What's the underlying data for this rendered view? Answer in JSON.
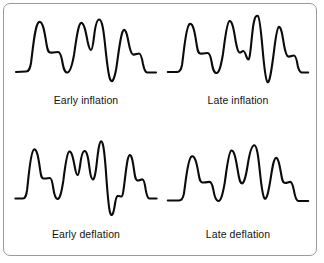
{
  "figure": {
    "background_color": "#ffffff",
    "border_color": "#9b9b9b",
    "trace_color": "#0b0b0b",
    "text_color": "#131313"
  },
  "panels": [
    {
      "id": "early-inflation",
      "caption": "Early inflation",
      "icon": "waveform-icon",
      "path": "M 4 64 L 14 63.5 C 17 63.5 18 61 19 55 C 21 40 23 16 27 14 C 31 12 33 27 34.5 36 C 35.5 42 36 44 38 44.5 C 41 45 44 44 46 44 C 48 44 49 47 50 52 C 51 58 52 64 55 64.5 C 58 65 60 58 62 47 C 64 34 66 16 69 15 C 72 14 74 25 75.5 33 C 77 40 78 42 79 42 C 80 42 81 37 82 29 C 83 20 84.5 12 87 11.5 C 90 11 91.5 22 93 36 C 94.5 50 96 66 98 71 C 100 76 102 72 104 62 C 106 50 108 30 110.5 24 C 113 18 115 26 116.5 34 C 118 42 119 46 121 46.5 C 123 47 125 45.5 127 45.5 C 129 45.5 130 50 131 56 C 132 61 133 64 135 64.5 L 144 64.5"
    },
    {
      "id": "late-inflation",
      "caption": "Late inflation",
      "icon": "waveform-icon",
      "path": "M 4 64 L 14 64 C 17 64 18 62 19 57 C 21 44 23 18 27 16 C 31 14 33 28 34.5 37 C 35.5 43 36 45 38 45.5 C 41 46 44 45 46 45 C 48 45 49 48 50 53 C 51 59 52 64.5 55 65 C 58 65.5 60 58 62 47 C 64 34 66 14 69 13 C 72 12 74 24 75.5 33 C 77 41 78 44 79.5 44.5 C 81 45 82 43 83.5 43 C 85 43 86 46 87 49 C 88 51 88.5 52 89.5 51 C 91 49.5 92 32 94 18 C 95.5 9 97 7 99 8 C 101 9 102.5 26 104 42 C 105.5 58 107 72 109 74 C 111 76 113 64 115 50 C 117 36 118.5 20 121 19 C 123.5 18 125 28 126.5 37 C 128 45 129 48 131 48.5 C 133 49 135 47.5 137 47.5 C 139 47.5 140 52 141 58 C 142 62 143 64 145 64.5 L 152 64.5"
    },
    {
      "id": "early-deflation",
      "caption": "Early deflation",
      "icon": "waveform-icon",
      "path": "M 4 68 L 13 68 C 16 68 17 65 18 59 C 20 44 22 20 26 18 C 30 16 32 30 33.5 39 C 34.5 45 35 47 37 47.5 C 40 48 43 47 45 47 C 47 47 48 51 49 57 C 50 63 51 68 54 68.5 C 57 69 59 61 61 50 C 63 37 65 21 68 20 C 71 19 73 28 74.5 35 C 76 42 77 44 78 44 C 79 44 80 40 81 34 C 82 27 83.5 20 86 19.5 C 89 19 90.5 26 92 36 C 93 43 94 48 96 48.5 C 97.5 49 99 45 100.5 34 C 102 22 103.5 10 106 9.5 C 108.5 9 110 22 111.5 38 C 113 56 114.5 76 116.5 82 C 118.5 88 120.5 84 122 76 C 123 70 124 66 125.5 65.5 C 127 65 128.5 66 130 66 C 131.5 66 132.5 61 134 50 C 136 36 137.5 24 140 23.5 C 142.5 23 144 32 145.5 41 C 146.5 47 147 49 149 49.5 C 151 50 153 48.5 155 48.5 C 157 48.5 158 53 159 59 C 160 64 161 67.5 163 68 L 172 68"
    },
    {
      "id": "late-deflation",
      "caption": "Late deflation",
      "icon": "waveform-icon",
      "path": "M 4 70 L 16 70 C 19 70 20 68 21 63 C 23 50 25 27 29 25 C 33 23 35 35 36.5 43 C 37.5 49 38 51 40 51.5 C 43 52 46 51 48 51 C 50 51 51 54 52 59 C 53 65 54 70 57 70.5 C 60 71 62 63 64 52 C 66 39 68 20 71 19 C 74 18 76 29 77.5 38 C 79 47 80 52 82 52.5 C 84 53 86 47 88 35 C 90 22 92 14 95 13.5 C 98 13 99.5 26 101 40 C 102.5 54 104 66 106 68 C 108 70 110 62 112 50 C 114 38 115.5 27 118 26.5 C 120.5 26 122 35 123.5 43 C 124.5 49 125 51.5 127 52 C 129 52.5 131 51 133 51 C 135 51 136 55 137 60 C 138 66 139 70 141.5 70.5 L 152 70.5"
    }
  ]
}
